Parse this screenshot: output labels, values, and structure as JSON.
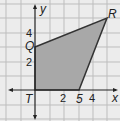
{
  "diagram": {
    "type": "coordinate-plane-polygon",
    "axes": {
      "x_label": "x",
      "y_label": "y"
    },
    "ticks": {
      "x": [
        "2",
        "4"
      ],
      "y": [
        "2",
        "4"
      ]
    },
    "vertices": [
      {
        "name": "Q",
        "x": 0,
        "y": 3
      },
      {
        "name": "R",
        "x": 5,
        "y": 5
      },
      {
        "name": "S",
        "x": 3,
        "y": 0
      },
      {
        "name": "T",
        "x": 0,
        "y": 0
      }
    ],
    "s_label": "5",
    "colors": {
      "grid": "#b8b8b8",
      "background": "#e9e9e9",
      "fill": "#a6a6a6",
      "stroke": "#333333"
    }
  }
}
